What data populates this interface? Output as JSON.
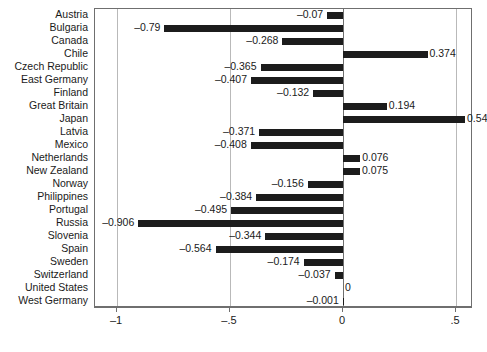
{
  "chart_data": {
    "type": "bar",
    "orientation": "horizontal",
    "title": "",
    "subtitle": "",
    "xlabel": "",
    "ylabel": "",
    "xlim": [
      -1.15,
      0.58
    ],
    "xticks": [
      -1,
      -0.5,
      0,
      0.5
    ],
    "xticklabels": [
      "–1",
      "–.5",
      "0",
      ".5"
    ],
    "grid": true,
    "grid_axis": "x",
    "legend": null,
    "bar_color": "#1c1c1c",
    "categories": [
      "Austria",
      "Bulgaria",
      "Canada",
      "Chile",
      "Czech Republic",
      "East Germany",
      "Finland",
      "Great Britain",
      "Japan",
      "Latvia",
      "Mexico",
      "Netherlands",
      "New Zealand",
      "Norway",
      "Philippines",
      "Portugal",
      "Russia",
      "Slovenia",
      "Spain",
      "Sweden",
      "Switzerland",
      "United States",
      "West Germany"
    ],
    "values": [
      -0.07,
      -0.79,
      -0.268,
      0.374,
      -0.365,
      -0.407,
      -0.132,
      0.194,
      0.54,
      -0.371,
      -0.408,
      0.076,
      0.075,
      -0.156,
      -0.384,
      -0.495,
      -0.906,
      -0.344,
      -0.564,
      -0.174,
      -0.037,
      0,
      -0.001
    ],
    "value_labels": [
      "–0.07",
      "–0.79",
      "–0.268",
      "0.374",
      "–0.365",
      "–0.407",
      "–0.132",
      "0.194",
      "0.54",
      "–0.371",
      "–0.408",
      "0.076",
      "0.075",
      "–0.156",
      "–0.384",
      "–0.495",
      "–0.906",
      "–0.344",
      "–0.564",
      "–0.174",
      "–0.037",
      "0",
      "–0.001"
    ]
  }
}
